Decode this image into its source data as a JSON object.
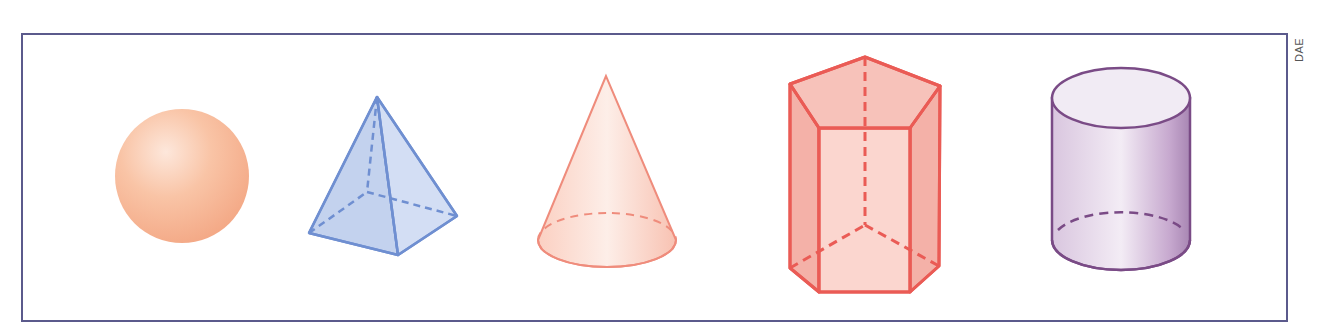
{
  "credit": "DAE",
  "colors": {
    "frame": "#5b5a8c",
    "sphere": "#f7b792",
    "pyramid_fill": "#c9d6f0",
    "pyramid_stroke": "#6f8fd1",
    "cone_fill": "#fcd9cc",
    "cone_stroke": "#ef8c7c",
    "prism_fill": "#f8c4bd",
    "prism_stroke": "#ea5b55",
    "cylinder_fill": "#ddcde2",
    "cylinder_stroke": "#7a4b86"
  },
  "shapes": [
    {
      "name": "sphere"
    },
    {
      "name": "square pyramid"
    },
    {
      "name": "cone"
    },
    {
      "name": "pentagonal prism"
    },
    {
      "name": "cylinder"
    }
  ]
}
